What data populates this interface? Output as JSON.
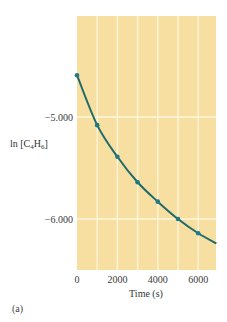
{
  "chart_data": {
    "type": "line",
    "title": "",
    "xlabel": "Time (s)",
    "ylabel": "ln [C4H6]",
    "ylabel_parts": {
      "prefix": "ln [C",
      "sub1": "4",
      "mid": "H",
      "sub2": "6",
      "suffix": "]"
    },
    "x": [
      0,
      1000,
      2000,
      3000,
      4000,
      5000,
      6000
    ],
    "series": [
      {
        "name": "ln [C4H6]",
        "values": [
          -4.59,
          -5.08,
          -5.39,
          -5.64,
          -5.83,
          -6.0,
          -6.14
        ]
      }
    ],
    "curve_end": {
      "x": 6900,
      "y": -6.24
    },
    "xlim": [
      0,
      6900
    ],
    "ylim": [
      -6.5,
      -4.0
    ],
    "xticks": [
      0,
      2000,
      4000,
      6000
    ],
    "xtick_labels": [
      "0",
      "2000",
      "4000",
      "6000"
    ],
    "x_gridlines": [
      0,
      1000,
      2000,
      3000,
      4000,
      5000,
      6000
    ],
    "yticks": [
      -5.0,
      -6.0
    ],
    "ytick_labels": [
      "−5.000",
      "−6.000"
    ],
    "grid": true,
    "legend": null,
    "colors": {
      "plot_background": "#F7DFA2",
      "gridline": "#FFF6DC",
      "curve": "#1E6A6A",
      "marker": "#1F7A86"
    }
  },
  "panel_label": "(a)"
}
